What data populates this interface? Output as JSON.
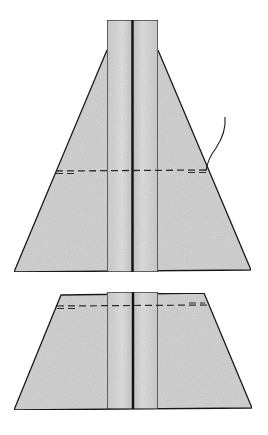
{
  "diagram": {
    "colors": {
      "fabric": "#d2d2d2",
      "fabric_light": "#e0e0e0",
      "fabric_strip": "#dadada",
      "outline": "#1a1a1a",
      "seam_line": "#111111",
      "dashed": "#2a2a2a",
      "background": "#ffffff"
    },
    "pieces": [
      {
        "name": "upper-piece",
        "trapezoid": {
          "top_y": 50,
          "bottom_y": 272,
          "top_left_x": 107,
          "top_right_x": 158,
          "bottom_left_x": 14,
          "bottom_right_x": 251
        },
        "strip": {
          "x_left": 107,
          "x_right": 158,
          "top_y": 20,
          "bottom_y": 272,
          "center_x": 132
        },
        "stitch_line": {
          "y": 171,
          "x_start": 56,
          "x_end": 208,
          "style": "dashed"
        },
        "thread": {
          "from": [
            207,
            168
          ],
          "to": [
            225,
            117
          ]
        }
      },
      {
        "name": "lower-piece",
        "trapezoid": {
          "top_y": 294,
          "bottom_y": 409,
          "top_left_x": 61,
          "top_right_x": 204,
          "bottom_left_x": 14,
          "bottom_right_x": 252
        },
        "strip": {
          "x_left": 107,
          "x_right": 158,
          "top_y": 292,
          "bottom_y": 409,
          "center_x": 133
        },
        "stitch_line": {
          "y": 306,
          "x_start": 57,
          "x_end": 209,
          "style": "dashed"
        }
      }
    ]
  }
}
